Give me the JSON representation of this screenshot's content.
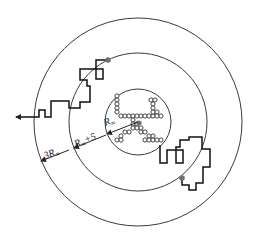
{
  "diagram": {
    "type": "DLA launch/kill circles schematic",
    "colors": {
      "stroke": "#3a3a3a",
      "walk": "#111111",
      "seed_dot": "#707070",
      "background": "#ffffff"
    },
    "center": [
      138,
      122
    ],
    "circles": [
      {
        "name": "inner-circle",
        "r": 33,
        "label_main": "R",
        "label_sub": "∞",
        "label_suffix": ""
      },
      {
        "name": "launch-circle",
        "r": 69,
        "label_main": "R",
        "label_sub": "∞",
        "label_suffix": "+5"
      },
      {
        "name": "kill-circle",
        "r": 104,
        "label_main": "3R",
        "label_sub": "∞",
        "label_suffix": ""
      }
    ],
    "labels": {
      "inner": {
        "main": "R",
        "sub": "∞",
        "suffix": ""
      },
      "launch": {
        "main": "R",
        "sub": "∞",
        "suffix": "+5"
      },
      "kill": {
        "main": "3R",
        "sub": "∞",
        "suffix": ""
      }
    },
    "seed": {
      "x": 139,
      "y": 123,
      "r": 2.6
    },
    "particle_radius": 2.1,
    "particles": [
      [
        117,
        96
      ],
      [
        117,
        100
      ],
      [
        117,
        104
      ],
      [
        117,
        108
      ],
      [
        117,
        112
      ],
      [
        121,
        116
      ],
      [
        125,
        116
      ],
      [
        129,
        116
      ],
      [
        133,
        116
      ],
      [
        137,
        116
      ],
      [
        141,
        116
      ],
      [
        145,
        116
      ],
      [
        149,
        116
      ],
      [
        153,
        116
      ],
      [
        151,
        100
      ],
      [
        155,
        100
      ],
      [
        153,
        104
      ],
      [
        153,
        108
      ],
      [
        153,
        112
      ],
      [
        157,
        112
      ],
      [
        157,
        116
      ],
      [
        161,
        116
      ],
      [
        133,
        120
      ],
      [
        133,
        124
      ],
      [
        137,
        124
      ],
      [
        133,
        128
      ],
      [
        137,
        128
      ],
      [
        141,
        128
      ],
      [
        129,
        132
      ],
      [
        125,
        132
      ],
      [
        121,
        136
      ],
      [
        117,
        140
      ],
      [
        121,
        140
      ],
      [
        141,
        132
      ],
      [
        145,
        132
      ],
      [
        149,
        136
      ],
      [
        153,
        136
      ],
      [
        145,
        140
      ],
      [
        149,
        140
      ],
      [
        153,
        140
      ],
      [
        157,
        140
      ],
      [
        161,
        140
      ]
    ],
    "walks": [
      {
        "name": "escaping-walk",
        "start": [
          108,
          60
        ],
        "points": [
          [
            108,
            60
          ],
          [
            96,
            60
          ],
          [
            96,
            79
          ],
          [
            103,
            79
          ],
          [
            103,
            69
          ],
          [
            80,
            69
          ],
          [
            80,
            80
          ],
          [
            87,
            80
          ],
          [
            87,
            86
          ],
          [
            90,
            86
          ],
          [
            90,
            102
          ],
          [
            80,
            102
          ],
          [
            80,
            108
          ],
          [
            69,
            108
          ],
          [
            69,
            101
          ],
          [
            51,
            101
          ],
          [
            51,
            117
          ],
          [
            45,
            117
          ],
          [
            45,
            110
          ],
          [
            39,
            110
          ],
          [
            39,
            117
          ],
          [
            16,
            117
          ]
        ],
        "arrow_end": [
          16,
          117
        ]
      },
      {
        "name": "sticking-walk",
        "start": [
          182,
          178
        ],
        "points": [
          [
            182,
            178
          ],
          [
            182,
            185
          ],
          [
            189,
            185
          ],
          [
            189,
            190
          ],
          [
            196,
            190
          ],
          [
            196,
            183
          ],
          [
            203,
            183
          ],
          [
            203,
            167
          ],
          [
            210,
            167
          ],
          [
            210,
            149
          ],
          [
            202,
            149
          ],
          [
            202,
            137
          ],
          [
            189,
            137
          ],
          [
            189,
            140
          ],
          [
            180,
            140
          ],
          [
            180,
            147
          ],
          [
            176,
            147
          ],
          [
            176,
            163
          ],
          [
            183,
            163
          ],
          [
            183,
            150
          ],
          [
            167,
            150
          ],
          [
            167,
            163
          ],
          [
            160,
            163
          ],
          [
            160,
            145
          ]
        ]
      }
    ],
    "launch_dots": [
      [
        108,
        60
      ],
      [
        182,
        178
      ]
    ],
    "dimension_lines": [
      {
        "name": "inner-radius-arrow",
        "from": [
          138,
          122
        ],
        "to": [
          107,
          134
        ]
      },
      {
        "name": "launch-radius-arrow",
        "from": [
          106,
          135
        ],
        "to": [
          74,
          148
        ]
      },
      {
        "name": "kill-radius-arrow",
        "from": [
          69,
          150
        ],
        "to": [
          41,
          161
        ]
      }
    ]
  }
}
